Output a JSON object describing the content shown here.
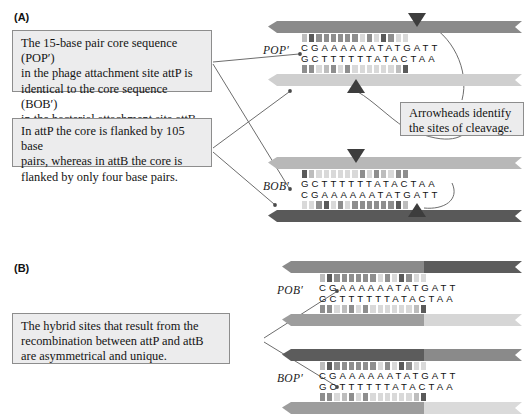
{
  "figure": {
    "panels": [
      {
        "id": "A",
        "label": "(A)"
      },
      {
        "id": "B",
        "label": "(B)"
      }
    ]
  },
  "callouts": {
    "core_sequence": {
      "name": "core-sequence-callout",
      "lines": [
        "The 15-base pair core sequence (POP′)",
        "in the phage attachment site attP is",
        "identical to the core sequence (BOB′)",
        "in the bacterial attachment site attB."
      ],
      "text": "The 15-base pair core sequence (POP′) in the phage attachment site attP is identical to the core sequence (BOB′) in the bacterial attachment site attB."
    },
    "flanking": {
      "name": "flanking-callout",
      "lines": [
        "In attP the core is flanked by 105 base",
        "pairs, whereas in attB the core is",
        "flanked by only four base pairs."
      ],
      "text": "In attP the core is flanked by 105 base pairs, whereas in attB the core is flanked by only four base pairs."
    },
    "arrowheads": {
      "name": "arrowheads-callout",
      "lines": [
        "Arrowheads identify",
        "the sites of cleavage."
      ],
      "text": "Arrowheads identify the sites of cleavage."
    },
    "hybrid": {
      "name": "hybrid-sites-callout",
      "lines": [
        "The hybrid sites that result from the",
        "recombination between attP and attB",
        "are asymmetrical and unique."
      ],
      "text": "The hybrid sites that result from the recombination between attP and attB are asymmetrical and unique."
    }
  },
  "sites": {
    "popprime": {
      "label": "POP′",
      "panel": "A",
      "top_strand": "CGAAAAAATATGATT",
      "bottom_strand": "GCTTTTTTATACTAA",
      "top_backbone_color": "#8a8a8a",
      "bottom_backbone_color": "#cfcfcf"
    },
    "bobprime": {
      "label": "BOB′",
      "panel": "A",
      "top_strand": "GCTTTTTTATACTAA",
      "bottom_strand": "CGAAAAAATATGATT",
      "top_backbone_color": "#b8b8b8",
      "bottom_backbone_color": "#595959"
    },
    "pobprime": {
      "label": "POB′",
      "panel": "B",
      "top_strand": "CGAAAAAATATGATT",
      "bottom_strand": "GCTTTTTTATACTAA",
      "top_backbone_left_color": "#8a8a8a",
      "top_backbone_right_color": "#5c5c5c",
      "bottom_backbone_left_color": "#9d9d9d",
      "bottom_backbone_right_color": "#d6d6d6"
    },
    "bopprime": {
      "label": "BOP′",
      "panel": "B",
      "top_strand": "CGAAAAAATATGATT",
      "bottom_strand": "GCTTTTTTATACTAA",
      "top_backbone_left_color": "#5c5c5c",
      "top_backbone_right_color": "#8a8a8a",
      "bottom_backbone_left_color": "#9d9d9d",
      "bottom_backbone_right_color": "#dadada"
    }
  },
  "cleavage_markers": {
    "name": "cleavage-arrowhead",
    "count_panel_a": 4,
    "color": "#3d3d3d"
  },
  "colors": {
    "callout_fill": "#ececed",
    "callout_border": "#8d8d8d",
    "leader_line": "#6d6d6d",
    "text": "#141414"
  }
}
